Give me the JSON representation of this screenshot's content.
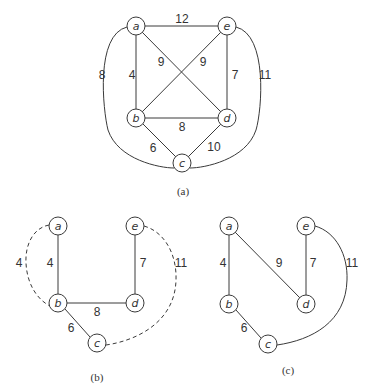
{
  "figures": [
    {
      "id": "a",
      "caption": "(a)",
      "description": "Complete weighted graph on 5 vertices",
      "nodes": [
        {
          "id": "a",
          "label": "a",
          "x": 136,
          "y": 26
        },
        {
          "id": "e",
          "label": "e",
          "x": 227,
          "y": 26
        },
        {
          "id": "b",
          "label": "b",
          "x": 136,
          "y": 118
        },
        {
          "id": "d",
          "label": "d",
          "x": 227,
          "y": 118
        },
        {
          "id": "c",
          "label": "c",
          "x": 182,
          "y": 163
        }
      ],
      "edges": [
        {
          "from": "a",
          "to": "e",
          "weight": "12",
          "style": "solid"
        },
        {
          "from": "a",
          "to": "b",
          "weight": "4",
          "style": "solid"
        },
        {
          "from": "a",
          "to": "d",
          "weight": "9",
          "style": "solid"
        },
        {
          "from": "e",
          "to": "b",
          "weight": "9",
          "style": "solid"
        },
        {
          "from": "e",
          "to": "d",
          "weight": "7",
          "style": "solid"
        },
        {
          "from": "b",
          "to": "d",
          "weight": "8",
          "style": "solid"
        },
        {
          "from": "b",
          "to": "c",
          "weight": "6",
          "style": "solid"
        },
        {
          "from": "d",
          "to": "c",
          "weight": "10",
          "style": "solid"
        },
        {
          "from": "a",
          "to": "c",
          "weight": "8",
          "style": "solid-curved"
        },
        {
          "from": "e",
          "to": "c",
          "weight": "11",
          "style": "solid-curved"
        }
      ]
    },
    {
      "id": "b",
      "caption": "(b)",
      "description": "Minimum spanning tree with dashed edges forming a tour",
      "nodes": [
        {
          "id": "a",
          "label": "a",
          "x": 58,
          "y": 226
        },
        {
          "id": "e",
          "label": "e",
          "x": 135,
          "y": 226
        },
        {
          "id": "b",
          "label": "b",
          "x": 58,
          "y": 303
        },
        {
          "id": "d",
          "label": "d",
          "x": 135,
          "y": 303
        },
        {
          "id": "c",
          "label": "c",
          "x": 97,
          "y": 343
        }
      ],
      "edges": [
        {
          "from": "a",
          "to": "b",
          "weight": "4",
          "style": "solid"
        },
        {
          "from": "e",
          "to": "d",
          "weight": "7",
          "style": "solid"
        },
        {
          "from": "b",
          "to": "d",
          "weight": "8",
          "style": "solid"
        },
        {
          "from": "b",
          "to": "c",
          "weight": "6",
          "style": "solid"
        },
        {
          "from": "a",
          "to": "b",
          "weight": "4",
          "style": "dashed-curved"
        },
        {
          "from": "e",
          "to": "c",
          "weight": "11",
          "style": "dashed-curved"
        }
      ]
    },
    {
      "id": "c",
      "caption": "(c)",
      "description": "Resulting tour",
      "nodes": [
        {
          "id": "a",
          "label": "a",
          "x": 229,
          "y": 226
        },
        {
          "id": "e",
          "label": "e",
          "x": 306,
          "y": 226
        },
        {
          "id": "b",
          "label": "b",
          "x": 229,
          "y": 304
        },
        {
          "id": "d",
          "label": "d",
          "x": 306,
          "y": 304
        },
        {
          "id": "c",
          "label": "c",
          "x": 268,
          "y": 344
        }
      ],
      "edges": [
        {
          "from": "a",
          "to": "b",
          "weight": "4",
          "style": "solid"
        },
        {
          "from": "a",
          "to": "d",
          "weight": "9",
          "style": "solid"
        },
        {
          "from": "e",
          "to": "d",
          "weight": "7",
          "style": "solid"
        },
        {
          "from": "b",
          "to": "c",
          "weight": "6",
          "style": "solid"
        },
        {
          "from": "e",
          "to": "c",
          "weight": "11",
          "style": "solid-curved"
        }
      ]
    }
  ],
  "labels": {
    "fa_nodes": [
      "a",
      "e",
      "b",
      "d",
      "c"
    ],
    "fa_weights": [
      "12",
      "4",
      "9",
      "9",
      "7",
      "8",
      "6",
      "10",
      "8",
      "11"
    ],
    "fb_nodes": [
      "a",
      "e",
      "b",
      "d",
      "c"
    ],
    "fb_weights": [
      "4",
      "4",
      "7",
      "11",
      "8",
      "6"
    ],
    "fc_nodes": [
      "a",
      "e",
      "b",
      "d",
      "c"
    ],
    "fc_weights": [
      "4",
      "9",
      "7",
      "11",
      "6"
    ],
    "captions": [
      "(a)",
      "(b)",
      "(c)"
    ]
  }
}
